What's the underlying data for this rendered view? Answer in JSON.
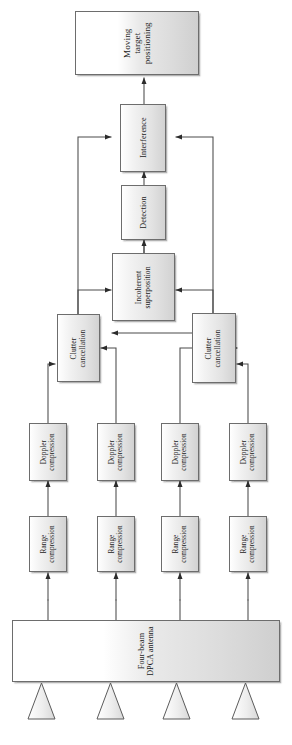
{
  "diagram": {
    "orientation": "rotated-90-ccw",
    "nodes": {
      "moving_target_positioning": "Moving\ntarget\npositioning",
      "interference": "Interference",
      "detection": "Detection",
      "incoherent_superposition": "Incoherent\nsuperposition",
      "clutter_cancellation_left": "Clutter\ncancellation",
      "clutter_cancellation_right": "Clutter\ncancellation",
      "doppler_compression_1": "Doppler\ncompression",
      "doppler_compression_2": "Doppler\ncompression",
      "doppler_compression_3": "Doppler\ncompression",
      "doppler_compression_4": "Doppler\ncompression",
      "range_compression_1": "Range\ncompression",
      "range_compression_2": "Range\ncompression",
      "range_compression_3": "Range\ncompression",
      "range_compression_4": "Range\ncompression",
      "antenna": "Four-beam\nDPCA antenna"
    },
    "beams": [
      "beam-1",
      "beam-2",
      "beam-3",
      "beam-4"
    ],
    "colors": {
      "stroke": "#4a4a4a",
      "box_border": "#6d6d6d",
      "box_fill_light": "#ffffff",
      "box_fill_dark": "#d2d2d2",
      "text": "#1a1a1a",
      "background": "#ffffff"
    },
    "edges": [
      {
        "from": "antenna",
        "to": "range_compression_1"
      },
      {
        "from": "antenna",
        "to": "range_compression_2"
      },
      {
        "from": "antenna",
        "to": "range_compression_3"
      },
      {
        "from": "antenna",
        "to": "range_compression_4"
      },
      {
        "from": "range_compression_1",
        "to": "doppler_compression_1"
      },
      {
        "from": "range_compression_2",
        "to": "doppler_compression_2"
      },
      {
        "from": "range_compression_3",
        "to": "doppler_compression_3"
      },
      {
        "from": "range_compression_4",
        "to": "doppler_compression_4"
      },
      {
        "from": "doppler_compression_1",
        "to": "clutter_cancellation_left"
      },
      {
        "from": "doppler_compression_2",
        "to": "clutter_cancellation_left"
      },
      {
        "from": "doppler_compression_3",
        "to": "clutter_cancellation_right"
      },
      {
        "from": "doppler_compression_4",
        "to": "clutter_cancellation_right"
      },
      {
        "from": "clutter_cancellation_left",
        "to": "incoherent_superposition"
      },
      {
        "from": "clutter_cancellation_right",
        "to": "incoherent_superposition"
      },
      {
        "from": "clutter_cancellation_left",
        "to": "interference"
      },
      {
        "from": "clutter_cancellation_right",
        "to": "interference"
      },
      {
        "from": "clutter_cancellation_right",
        "to": "clutter_cancellation_left"
      },
      {
        "from": "incoherent_superposition",
        "to": "detection"
      },
      {
        "from": "detection",
        "to": "interference"
      },
      {
        "from": "interference",
        "to": "moving_target_positioning"
      }
    ]
  }
}
